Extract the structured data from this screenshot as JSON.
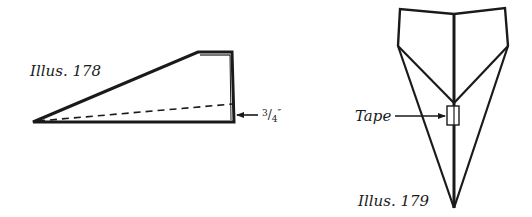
{
  "illustrations": [
    {
      "id": "illus-178",
      "caption": "Illus. 178",
      "measurement": {
        "numerator": "3",
        "denominator": "4",
        "unit": "″",
        "text": "3/4″"
      }
    },
    {
      "id": "illus-179",
      "caption": "Illus. 179",
      "callout": "Tape"
    }
  ],
  "colors": {
    "ink": "#1a1a1a",
    "background": "#ffffff"
  }
}
